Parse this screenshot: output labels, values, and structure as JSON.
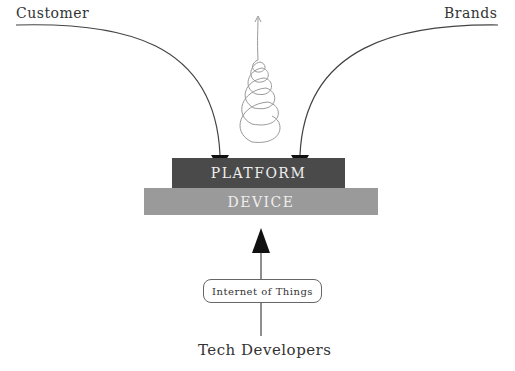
{
  "labels": {
    "customer": "Customer",
    "brands": "Brands",
    "tech_developers": "Tech Developers"
  },
  "boxes": {
    "platform": {
      "label": "PLATFORM",
      "color": "#4a4a4a"
    },
    "device": {
      "label": "DEVICE",
      "color": "#9a9a9a"
    },
    "iot": {
      "label": "Internet of Things"
    }
  }
}
